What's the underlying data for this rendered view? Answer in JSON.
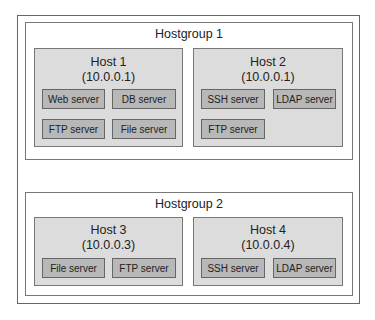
{
  "hostgroups": [
    {
      "title": "Hostgroup 1",
      "hosts": [
        {
          "name": "Host 1",
          "ip": "(10.0.0.1)",
          "services": [
            "Web server",
            "DB server",
            "FTP server",
            "File server"
          ]
        },
        {
          "name": "Host 2",
          "ip": "(10.0.0.1)",
          "services": [
            "SSH server",
            "LDAP server",
            "FTP server"
          ]
        }
      ]
    },
    {
      "title": "Hostgroup 2",
      "hosts": [
        {
          "name": "Host 3",
          "ip": "(10.0.0.3)",
          "services": [
            "File server",
            "FTP server"
          ]
        },
        {
          "name": "Host 4",
          "ip": "(10.0.0.4)",
          "services": [
            "SSH server",
            "LDAP server"
          ]
        }
      ]
    }
  ],
  "colors": {
    "host_fill": "#dcdcdc",
    "service_fill": "#b8b8b8",
    "border": "#777777"
  }
}
